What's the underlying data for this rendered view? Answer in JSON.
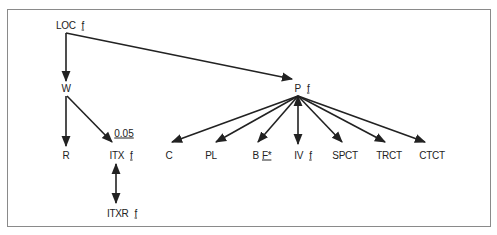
{
  "diagram": {
    "nodes": {
      "loc": {
        "name": "LOC",
        "mark": "f"
      },
      "w": {
        "name": "W"
      },
      "r": {
        "name": "R"
      },
      "itx": {
        "name": "ITX",
        "mark": "f"
      },
      "itxr": {
        "name": "ITXR",
        "mark": "f"
      },
      "p": {
        "name": "P",
        "mark": "f"
      },
      "c": {
        "name": "C"
      },
      "pl": {
        "name": "PL"
      },
      "b": {
        "name": "B",
        "mark": "F*"
      },
      "iv": {
        "name": "IV",
        "mark": "f"
      },
      "spct": {
        "name": "SPCT"
      },
      "trct": {
        "name": "TRCT"
      },
      "ctct": {
        "name": "CTCT"
      }
    },
    "edge_labels": {
      "w_itx": "0.05"
    },
    "edges": [
      {
        "from": "LOC",
        "to": "W",
        "type": "arrow"
      },
      {
        "from": "LOC",
        "to": "P",
        "type": "arrow"
      },
      {
        "from": "W",
        "to": "R",
        "type": "arrow"
      },
      {
        "from": "W",
        "to": "ITX",
        "type": "arrow",
        "label": "0.05"
      },
      {
        "from": "ITX",
        "to": "ITXR",
        "type": "double-arrow"
      },
      {
        "from": "P",
        "to": "C",
        "type": "arrow"
      },
      {
        "from": "P",
        "to": "PL",
        "type": "arrow"
      },
      {
        "from": "P",
        "to": "B",
        "type": "arrow"
      },
      {
        "from": "P",
        "to": "IV",
        "type": "double-arrow"
      },
      {
        "from": "P",
        "to": "SPCT",
        "type": "arrow"
      },
      {
        "from": "P",
        "to": "TRCT",
        "type": "arrow"
      },
      {
        "from": "P",
        "to": "CTCT",
        "type": "arrow"
      }
    ]
  }
}
